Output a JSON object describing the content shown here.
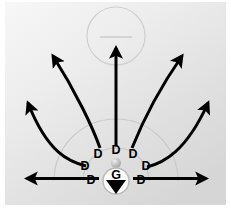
{
  "figure": {
    "title": "",
    "type": "vector-field-diagram",
    "canvas": {
      "width": 231,
      "height": 223
    },
    "background": {
      "plate": {
        "x": 5,
        "y": 2,
        "width": 221,
        "height": 203
      },
      "color_light": "#f3f3f3",
      "color_dark": "#d9d9d9",
      "page_color": "#ffffff"
    },
    "source_marker": {
      "name": "G",
      "label": "G",
      "center_x": 116,
      "center_y": 181,
      "radius": 13,
      "fill": "#ffffff",
      "outline": "#b8b8b8",
      "glyph": "down-triangle",
      "glyph_color": "#000000"
    },
    "bead": {
      "center_x": 116,
      "center_y": 163,
      "radius": 5,
      "color": "#b0b0b0",
      "highlight": "#e8e8e8"
    },
    "detector_label": "D",
    "detectors": [
      {
        "label": "D",
        "x": 91,
        "y": 181
      },
      {
        "label": "D",
        "x": 85,
        "y": 167
      },
      {
        "label": "D",
        "x": 98,
        "y": 155
      },
      {
        "label": "D",
        "x": 116,
        "y": 151
      },
      {
        "label": "D",
        "x": 133,
        "y": 155
      },
      {
        "label": "D",
        "x": 146,
        "y": 167
      },
      {
        "label": "D",
        "x": 141,
        "y": 181
      }
    ],
    "top_circle": {
      "center_x": 116,
      "center_y": 36,
      "radius": 29,
      "stroke": "#cfcfcf",
      "inner_line": {
        "x1": 100,
        "y1": 37,
        "x2": 132,
        "y2": 37,
        "stroke": "#c9c9c9"
      }
    },
    "arcs": [
      {
        "name": "inner-arc",
        "center_x": 116,
        "center_y": 181,
        "radius": 33,
        "stroke": "#c6c6c6"
      },
      {
        "name": "outer-arc",
        "center_x": 116,
        "center_y": 181,
        "radius": 62,
        "stroke": "#c9c9c9"
      }
    ],
    "arrows": {
      "color": "#000000",
      "stroke_width": 3,
      "items": [
        {
          "name": "arrow-far-left",
          "direction": "left",
          "curved": false
        },
        {
          "name": "arrow-upper-left",
          "direction": "up-left",
          "curved": true
        },
        {
          "name": "arrow-left",
          "direction": "up-left",
          "curved": true
        },
        {
          "name": "arrow-up",
          "direction": "up",
          "curved": false
        },
        {
          "name": "arrow-right",
          "direction": "up-right",
          "curved": true
        },
        {
          "name": "arrow-upper-right",
          "direction": "up-right",
          "curved": true
        },
        {
          "name": "arrow-far-right",
          "direction": "right",
          "curved": false
        }
      ]
    }
  }
}
